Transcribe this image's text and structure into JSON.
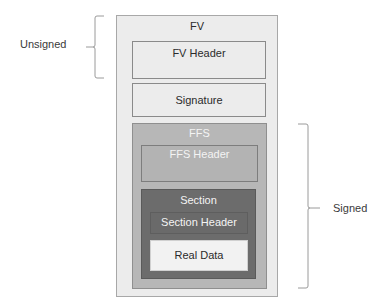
{
  "diagram": {
    "boxes": {
      "fv": {
        "label": "FV"
      },
      "fv_header": {
        "label": "FV Header"
      },
      "signature": {
        "label": "Signature"
      },
      "ffs": {
        "label": "FFS"
      },
      "ffs_header": {
        "label": "FFS Header"
      },
      "section": {
        "label": "Section"
      },
      "section_header": {
        "label": "Section Header"
      },
      "real_data": {
        "label": "Real Data"
      }
    },
    "annotations": {
      "unsigned": {
        "label": "Unsigned",
        "covers": [
          "FV",
          "FV Header"
        ]
      },
      "signed": {
        "label": "Signed",
        "covers": [
          "FFS",
          "FFS Header",
          "Section",
          "Section Header",
          "Real Data"
        ]
      }
    },
    "colors": {
      "fv_bg": "#ececec",
      "ffs_bg": "#b7b7b7",
      "section_bg": "#6c6c6c",
      "real_data_bg": "#f2f2f2",
      "bracket": "#9a9a9a"
    }
  }
}
